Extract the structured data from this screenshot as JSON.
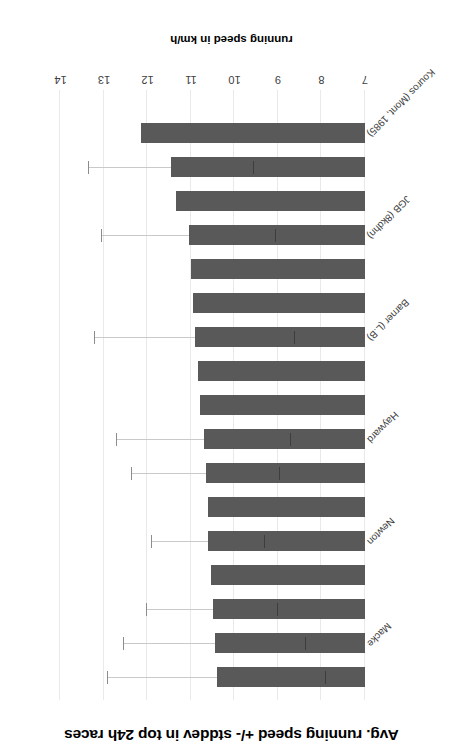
{
  "chart_data": {
    "type": "bar",
    "orientation": "horizontal",
    "title": "Avg. running speed +/- stddev in top 24h races",
    "xlabel": "running speed in km/h",
    "ylabel": "",
    "xlim": [
      7,
      14
    ],
    "xticks": [
      "14",
      "13",
      "12",
      "11",
      "10",
      "9",
      "8",
      "7"
    ],
    "xticks_order_in_image": "descending-left-to-right (image is rotated 180 degrees)",
    "grid": true,
    "legend": null,
    "bar_color": "#595959",
    "gridline_color": "#e9e9e9",
    "baseline_value": 7,
    "categories": [
      "Kouros (Mont, 1985)",
      "",
      "",
      "JGB (8kdhn)",
      "",
      "",
      "Barner (L.B)",
      "",
      "",
      "Hayward",
      "",
      "",
      "Newton",
      "",
      "",
      "Macke",
      ""
    ],
    "labeled_categories": [
      "Kouros (Mont, 1985)",
      "JGB (8kdhn)",
      "Barner (L.B)",
      "Hayward",
      "Newton",
      "Macke"
    ],
    "values": [
      12.15,
      11.45,
      11.35,
      11.05,
      11.0,
      10.95,
      10.9,
      10.85,
      10.8,
      10.7,
      10.65,
      10.6,
      10.6,
      10.55,
      10.5,
      10.45,
      10.4
    ],
    "errors": [
      0.0,
      1.9,
      0.0,
      2.0,
      0.0,
      0.0,
      2.3,
      0.0,
      0.0,
      2.0,
      1.7,
      0.0,
      1.3,
      0.0,
      1.5,
      2.1,
      2.5
    ],
    "n_bars": 17
  },
  "axis": {
    "tick_labels": [
      "14",
      "13",
      "12",
      "11",
      "10",
      "9",
      "8",
      "7"
    ]
  }
}
